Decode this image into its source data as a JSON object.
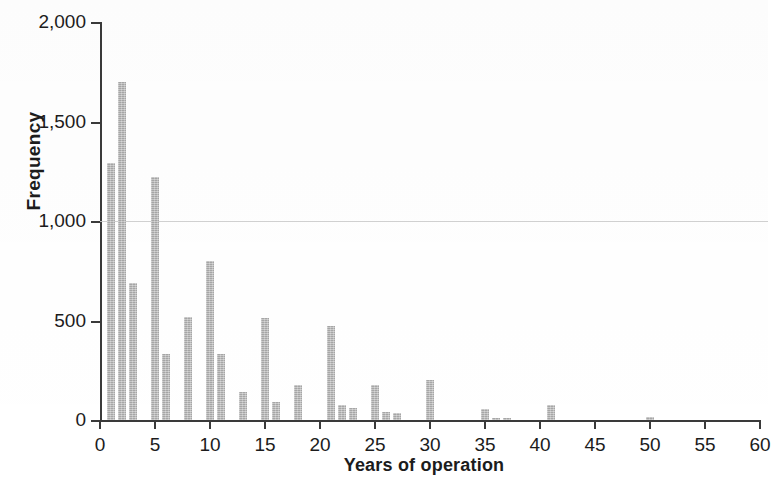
{
  "chart_data": {
    "type": "bar",
    "title": "",
    "xlabel": "Years of operation",
    "ylabel": "Frequency",
    "xlim": [
      0,
      60
    ],
    "ylim": [
      0,
      2000
    ],
    "grid": true,
    "gridlines_y": [
      1000
    ],
    "legend": null,
    "y_ticks": [
      0,
      500,
      1000,
      1500,
      2000
    ],
    "y_tick_labels": [
      "0",
      "500",
      "1,000",
      "1,500",
      "2,000"
    ],
    "x_ticks": [
      0,
      5,
      10,
      15,
      20,
      25,
      30,
      35,
      40,
      45,
      50,
      55,
      60
    ],
    "x_tick_labels": [
      "0",
      "5",
      "10",
      "15",
      "20",
      "25",
      "30",
      "35",
      "40",
      "45",
      "50",
      "55",
      "60"
    ],
    "bar_color": "#b6b6b6",
    "axis_color": "#3a3a3a",
    "x": [
      1,
      2,
      3,
      4,
      5,
      6,
      7,
      8,
      9,
      10,
      11,
      12,
      13,
      14,
      15,
      16,
      17,
      18,
      19,
      20,
      21,
      22,
      23,
      24,
      25,
      26,
      27,
      28,
      29,
      30,
      31,
      32,
      33,
      34,
      35,
      36,
      37,
      38,
      39,
      40,
      41,
      42,
      43,
      44,
      45,
      46,
      47,
      48,
      49,
      50,
      51,
      52,
      53,
      54,
      55,
      56,
      57,
      58,
      59,
      60
    ],
    "values": [
      1290,
      1700,
      690,
      0,
      1220,
      330,
      0,
      520,
      0,
      800,
      330,
      0,
      140,
      0,
      515,
      90,
      0,
      175,
      0,
      0,
      470,
      75,
      60,
      0,
      175,
      40,
      35,
      0,
      0,
      200,
      0,
      0,
      0,
      0,
      55,
      10,
      10,
      0,
      0,
      0,
      75,
      0,
      0,
      0,
      0,
      0,
      0,
      0,
      0,
      15,
      0,
      0,
      0,
      0,
      0,
      0,
      0,
      0,
      0,
      0
    ]
  },
  "axes": {
    "y_title": "Frequency",
    "x_title": "Years of operation"
  }
}
